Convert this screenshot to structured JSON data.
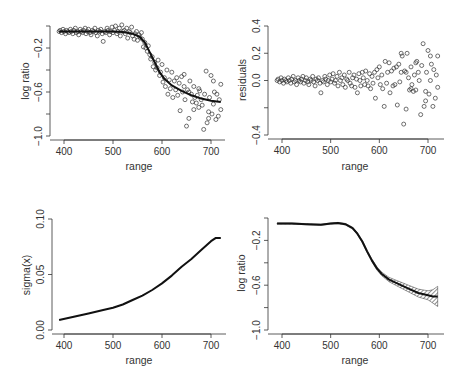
{
  "figure": {
    "panels": [
      {
        "id": "top-left",
        "xlabel": "range",
        "ylabel": "log ratio"
      },
      {
        "id": "top-right",
        "xlabel": "range",
        "ylabel": "residuals"
      },
      {
        "id": "bottom-left",
        "xlabel": "range",
        "ylabel": "sigma(x)"
      },
      {
        "id": "bottom-right",
        "xlabel": "range",
        "ylabel": "log ratio"
      }
    ]
  },
  "chart_data": [
    {
      "type": "scatter",
      "panel": "top-left",
      "title": "",
      "xlabel": "range",
      "ylabel": "log ratio",
      "xlim": [
        390,
        720
      ],
      "ylim": [
        -1.0,
        0.0
      ],
      "xticks": [
        400,
        500,
        600,
        700
      ],
      "yticks": [
        -0.2,
        -0.6,
        -1.0
      ],
      "ytick_marks": [
        0.0,
        -0.2,
        -0.4,
        -0.6,
        -0.8,
        -1.0
      ],
      "grid": false,
      "fit_curve": {
        "x": [
          390,
          420,
          450,
          480,
          500,
          520,
          540,
          555,
          565,
          575,
          585,
          595,
          605,
          620,
          640,
          660,
          680,
          700,
          720
        ],
        "y": [
          -0.05,
          -0.05,
          -0.05,
          -0.05,
          -0.05,
          -0.055,
          -0.07,
          -0.1,
          -0.15,
          -0.24,
          -0.33,
          -0.42,
          -0.48,
          -0.54,
          -0.59,
          -0.63,
          -0.66,
          -0.68,
          -0.69
        ]
      },
      "points": [
        [
          390,
          -0.05
        ],
        [
          392,
          -0.04
        ],
        [
          395,
          -0.06
        ],
        [
          398,
          -0.03
        ],
        [
          400,
          -0.05
        ],
        [
          403,
          -0.07
        ],
        [
          405,
          -0.04
        ],
        [
          408,
          -0.05
        ],
        [
          410,
          -0.06
        ],
        [
          413,
          -0.03
        ],
        [
          415,
          -0.05
        ],
        [
          418,
          -0.07
        ],
        [
          420,
          -0.04
        ],
        [
          423,
          -0.02
        ],
        [
          425,
          -0.06
        ],
        [
          428,
          -0.05
        ],
        [
          430,
          -0.08
        ],
        [
          433,
          -0.03
        ],
        [
          435,
          -0.05
        ],
        [
          438,
          -0.06
        ],
        [
          440,
          -0.04
        ],
        [
          443,
          -0.02
        ],
        [
          445,
          -0.07
        ],
        [
          448,
          -0.05
        ],
        [
          450,
          -0.03
        ],
        [
          453,
          -0.06
        ],
        [
          455,
          -0.08
        ],
        [
          458,
          -0.04
        ],
        [
          460,
          -0.05
        ],
        [
          463,
          -0.02
        ],
        [
          465,
          -0.06
        ],
        [
          468,
          -0.09
        ],
        [
          470,
          -0.04
        ],
        [
          473,
          -0.05
        ],
        [
          475,
          -0.03
        ],
        [
          478,
          -0.07
        ],
        [
          480,
          -0.14
        ],
        [
          483,
          -0.05
        ],
        [
          485,
          -0.06
        ],
        [
          488,
          -0.02
        ],
        [
          490,
          -0.04
        ],
        [
          493,
          -0.08
        ],
        [
          495,
          -0.05
        ],
        [
          498,
          -0.01
        ],
        [
          500,
          -0.06
        ],
        [
          503,
          -0.04
        ],
        [
          505,
          -0.0
        ],
        [
          508,
          -0.07
        ],
        [
          510,
          -0.05
        ],
        [
          513,
          -0.02
        ],
        [
          515,
          -0.09
        ],
        [
          518,
          0.01
        ],
        [
          520,
          -0.05
        ],
        [
          523,
          -0.04
        ],
        [
          525,
          -0.07
        ],
        [
          528,
          -0.02
        ],
        [
          530,
          -0.11
        ],
        [
          533,
          -0.05
        ],
        [
          535,
          -0.06
        ],
        [
          538,
          -0.01
        ],
        [
          540,
          -0.09
        ],
        [
          543,
          -0.12
        ],
        [
          545,
          -0.07
        ],
        [
          548,
          -0.05
        ],
        [
          550,
          -0.13
        ],
        [
          553,
          -0.08
        ],
        [
          555,
          -0.1
        ],
        [
          558,
          -0.06
        ],
        [
          560,
          -0.12
        ],
        [
          562,
          -0.19
        ],
        [
          565,
          -0.15
        ],
        [
          567,
          -0.2
        ],
        [
          570,
          -0.23
        ],
        [
          572,
          -0.18
        ],
        [
          575,
          -0.26
        ],
        [
          577,
          -0.3
        ],
        [
          580,
          -0.28
        ],
        [
          582,
          -0.37
        ],
        [
          585,
          -0.33
        ],
        [
          587,
          -0.4
        ],
        [
          590,
          -0.38
        ],
        [
          592,
          -0.31
        ],
        [
          595,
          -0.45
        ],
        [
          597,
          -0.42
        ],
        [
          600,
          -0.35
        ],
        [
          602,
          -0.51
        ],
        [
          605,
          -0.47
        ],
        [
          607,
          -0.55
        ],
        [
          610,
          -0.4
        ],
        [
          612,
          -0.62
        ],
        [
          615,
          -0.49
        ],
        [
          617,
          -0.57
        ],
        [
          620,
          -0.42
        ],
        [
          622,
          -0.65
        ],
        [
          625,
          -0.5
        ],
        [
          628,
          -0.58
        ],
        [
          630,
          -0.47
        ],
        [
          632,
          -0.63
        ],
        [
          635,
          -0.52
        ],
        [
          637,
          -0.77
        ],
        [
          640,
          -0.46
        ],
        [
          642,
          -0.6
        ],
        [
          645,
          -0.55
        ],
        [
          647,
          -0.67
        ],
        [
          650,
          -0.91
        ],
        [
          652,
          -0.58
        ],
        [
          655,
          -0.84
        ],
        [
          657,
          -0.5
        ],
        [
          660,
          -0.62
        ],
        [
          662,
          -0.69
        ],
        [
          665,
          -0.55
        ],
        [
          667,
          -0.65
        ],
        [
          670,
          -0.7
        ],
        [
          672,
          -0.63
        ],
        [
          675,
          -0.74
        ],
        [
          677,
          -0.59
        ],
        [
          680,
          -0.67
        ],
        [
          682,
          -0.72
        ],
        [
          685,
          -0.94
        ],
        [
          687,
          -0.62
        ],
        [
          690,
          -0.41
        ],
        [
          692,
          -0.88
        ],
        [
          695,
          -0.78
        ],
        [
          697,
          -0.65
        ],
        [
          700,
          -0.45
        ],
        [
          702,
          -0.8
        ],
        [
          705,
          -0.71
        ],
        [
          707,
          -0.6
        ],
        [
          710,
          -0.85
        ],
        [
          712,
          -0.62
        ],
        [
          715,
          -0.82
        ],
        [
          717,
          -0.67
        ],
        [
          720,
          -0.53
        ],
        [
          720,
          -0.76
        ],
        [
          705,
          -0.5
        ],
        [
          695,
          -0.84
        ],
        [
          675,
          -0.57
        ],
        [
          665,
          -0.76
        ],
        [
          655,
          -0.6
        ],
        [
          645,
          -0.44
        ]
      ]
    },
    {
      "type": "scatter",
      "panel": "top-right",
      "title": "",
      "xlabel": "range",
      "ylabel": "residuals",
      "xlim": [
        390,
        720
      ],
      "ylim": [
        -0.4,
        0.4
      ],
      "xticks": [
        400,
        500,
        600,
        700
      ],
      "yticks": [
        -0.4,
        0.0,
        0.2,
        0.4
      ],
      "ytick_marks": [
        0.4,
        0.2,
        0.0,
        -0.2,
        -0.4
      ],
      "grid": false,
      "points": [
        [
          390,
          0.0
        ],
        [
          392,
          0.01
        ],
        [
          395,
          -0.01
        ],
        [
          398,
          0.02
        ],
        [
          400,
          0.0
        ],
        [
          403,
          -0.02
        ],
        [
          405,
          0.01
        ],
        [
          408,
          0.0
        ],
        [
          410,
          -0.01
        ],
        [
          413,
          0.02
        ],
        [
          415,
          0.0
        ],
        [
          418,
          -0.02
        ],
        [
          420,
          0.01
        ],
        [
          423,
          0.03
        ],
        [
          425,
          -0.01
        ],
        [
          428,
          0.0
        ],
        [
          430,
          -0.03
        ],
        [
          433,
          0.02
        ],
        [
          435,
          0.0
        ],
        [
          438,
          -0.01
        ],
        [
          440,
          0.01
        ],
        [
          443,
          0.03
        ],
        [
          445,
          -0.02
        ],
        [
          448,
          0.0
        ],
        [
          450,
          0.02
        ],
        [
          453,
          -0.01
        ],
        [
          455,
          -0.03
        ],
        [
          458,
          0.01
        ],
        [
          460,
          0.0
        ],
        [
          463,
          0.03
        ],
        [
          465,
          -0.01
        ],
        [
          468,
          -0.04
        ],
        [
          470,
          0.01
        ],
        [
          473,
          0.0
        ],
        [
          475,
          0.02
        ],
        [
          478,
          -0.02
        ],
        [
          480,
          -0.09
        ],
        [
          483,
          0.0
        ],
        [
          485,
          -0.01
        ],
        [
          488,
          0.03
        ],
        [
          490,
          0.01
        ],
        [
          493,
          -0.03
        ],
        [
          495,
          0.0
        ],
        [
          498,
          0.04
        ],
        [
          500,
          -0.01
        ],
        [
          503,
          0.01
        ],
        [
          505,
          0.05
        ],
        [
          508,
          -0.02
        ],
        [
          510,
          0.0
        ],
        [
          513,
          0.03
        ],
        [
          515,
          -0.04
        ],
        [
          518,
          0.06
        ],
        [
          520,
          0.0
        ],
        [
          523,
          0.02
        ],
        [
          525,
          -0.03
        ],
        [
          528,
          0.04
        ],
        [
          530,
          -0.05
        ],
        [
          533,
          0.01
        ],
        [
          535,
          0.0
        ],
        [
          538,
          0.06
        ],
        [
          540,
          -0.02
        ],
        [
          543,
          -0.04
        ],
        [
          545,
          0.02
        ],
        [
          548,
          0.04
        ],
        [
          550,
          -0.05
        ],
        [
          553,
          0.01
        ],
        [
          555,
          -0.09
        ],
        [
          558,
          0.05
        ],
        [
          560,
          0.0
        ],
        [
          562,
          -0.04
        ],
        [
          565,
          0.06
        ],
        [
          567,
          0.02
        ],
        [
          570,
          -0.03
        ],
        [
          572,
          0.07
        ],
        [
          575,
          0.0
        ],
        [
          577,
          -0.04
        ],
        [
          580,
          0.05
        ],
        [
          582,
          -0.06
        ],
        [
          585,
          0.03
        ],
        [
          587,
          -0.02
        ],
        [
          590,
          0.06
        ],
        [
          592,
          -0.13
        ],
        [
          595,
          0.08
        ],
        [
          597,
          0.02
        ],
        [
          600,
          0.1
        ],
        [
          602,
          -0.03
        ],
        [
          605,
          0.04
        ],
        [
          607,
          -0.06
        ],
        [
          610,
          -0.19
        ],
        [
          612,
          0.14
        ],
        [
          615,
          -0.02
        ],
        [
          617,
          0.06
        ],
        [
          620,
          0.13
        ],
        [
          622,
          -0.09
        ],
        [
          625,
          0.07
        ],
        [
          628,
          -0.04
        ],
        [
          630,
          0.09
        ],
        [
          632,
          -0.03
        ],
        [
          635,
          0.1
        ],
        [
          637,
          -0.18
        ],
        [
          640,
          0.12
        ],
        [
          642,
          -0.01
        ],
        [
          645,
          0.06
        ],
        [
          647,
          0.18
        ],
        [
          650,
          -0.32
        ],
        [
          652,
          0.07
        ],
        [
          655,
          -0.21
        ],
        [
          657,
          0.2
        ],
        [
          660,
          0.02
        ],
        [
          662,
          -0.07
        ],
        [
          665,
          0.1
        ],
        [
          667,
          -0.03
        ],
        [
          670,
          -0.08
        ],
        [
          672,
          0.04
        ],
        [
          675,
          -0.07
        ],
        [
          677,
          0.14
        ],
        [
          680,
          0.06
        ],
        [
          682,
          0.0
        ],
        [
          685,
          -0.25
        ],
        [
          687,
          0.11
        ],
        [
          690,
          0.27
        ],
        [
          692,
          -0.19
        ],
        [
          695,
          -0.08
        ],
        [
          697,
          0.06
        ],
        [
          700,
          0.22
        ],
        [
          702,
          -0.1
        ],
        [
          705,
          0.0
        ],
        [
          707,
          0.12
        ],
        [
          710,
          -0.19
        ],
        [
          712,
          0.08
        ],
        [
          715,
          -0.13
        ],
        [
          717,
          0.04
        ],
        [
          720,
          0.18
        ],
        [
          720,
          -0.05
        ],
        [
          705,
          0.18
        ],
        [
          695,
          -0.15
        ],
        [
          675,
          0.13
        ],
        [
          665,
          -0.06
        ],
        [
          655,
          0.06
        ],
        [
          645,
          0.2
        ]
      ]
    },
    {
      "type": "line",
      "panel": "bottom-left",
      "title": "",
      "xlabel": "range",
      "ylabel": "sigma(x)",
      "xlim": [
        390,
        720
      ],
      "ylim": [
        0.0,
        0.1
      ],
      "xticks": [
        400,
        500,
        600,
        700
      ],
      "yticks": [
        0.0,
        0.05,
        0.1
      ],
      "grid": false,
      "x": [
        390,
        420,
        450,
        480,
        500,
        520,
        540,
        560,
        580,
        600,
        620,
        640,
        660,
        680,
        700,
        710,
        720
      ],
      "y": [
        0.009,
        0.012,
        0.015,
        0.018,
        0.02,
        0.023,
        0.027,
        0.031,
        0.036,
        0.042,
        0.049,
        0.057,
        0.064,
        0.072,
        0.08,
        0.083,
        0.083
      ]
    },
    {
      "type": "line",
      "panel": "bottom-right",
      "title": "",
      "xlabel": "range",
      "ylabel": "log ratio",
      "xlim": [
        390,
        720
      ],
      "ylim": [
        -1.0,
        0.0
      ],
      "xticks": [
        400,
        500,
        600,
        700
      ],
      "yticks": [
        -0.2,
        -0.6,
        -1.0
      ],
      "ytick_marks": [
        0.0,
        -0.2,
        -0.4,
        -0.6,
        -0.8,
        -1.0
      ],
      "grid": false,
      "x": [
        390,
        420,
        450,
        480,
        500,
        515,
        530,
        545,
        555,
        565,
        575,
        585,
        595,
        605,
        620,
        640,
        660,
        680,
        700,
        710,
        720
      ],
      "y": [
        -0.05,
        -0.05,
        -0.055,
        -0.06,
        -0.05,
        -0.045,
        -0.055,
        -0.09,
        -0.14,
        -0.21,
        -0.3,
        -0.38,
        -0.45,
        -0.5,
        -0.55,
        -0.59,
        -0.63,
        -0.67,
        -0.69,
        -0.7,
        -0.7
      ],
      "band_halfwidth": [
        0.005,
        0.005,
        0.005,
        0.005,
        0.005,
        0.006,
        0.007,
        0.008,
        0.009,
        0.01,
        0.011,
        0.012,
        0.014,
        0.016,
        0.02,
        0.025,
        0.03,
        0.035,
        0.04,
        0.06,
        0.09
      ]
    }
  ]
}
